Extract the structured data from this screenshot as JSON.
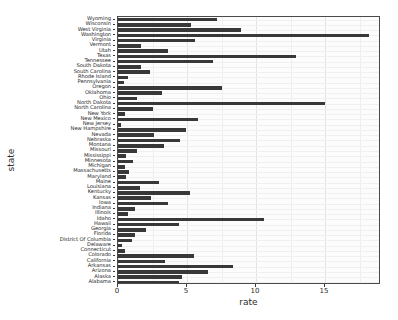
{
  "chart_data": {
    "type": "bar",
    "orientation": "horizontal",
    "title": "",
    "xlabel": "rate",
    "ylabel": "state",
    "xlim": [
      0,
      19.05
    ],
    "xticks": [
      0,
      5,
      10,
      15
    ],
    "xtick_labels": [
      "0",
      "5",
      "10",
      "15"
    ],
    "grid": true,
    "legend": "none",
    "bar_color": "#383838",
    "panel_color": "#fcfcfc",
    "categories": [
      "Wyoming",
      "Wisconsin",
      "West Virginia",
      "Washington",
      "Virginia",
      "Vermont",
      "Utah",
      "Texas",
      "Tennessee",
      "South Dakota",
      "South Carolina",
      "Rhode Island",
      "Pennsylvania",
      "Oregon",
      "Oklahoma",
      "Ohio",
      "North Dakota",
      "North Carolina",
      "New York",
      "New Mexico",
      "New Jersey",
      "New Hampshire",
      "Nevada",
      "Nebraska",
      "Montana",
      "Missouri",
      "Mississippi",
      "Minnesota",
      "Michigan",
      "Massachusetts",
      "Maryland",
      "Maine",
      "Louisiana",
      "Kentucky",
      "Kansas",
      "Iowa",
      "Indiana",
      "Illinois",
      "Idaho",
      "Hawaii",
      "Georgia",
      "Florida",
      "District Of Columbia",
      "Delaware",
      "Connecticut",
      "Colorado",
      "California",
      "Arkansas",
      "Arizona",
      "Alaska",
      "Alabama"
    ],
    "values": [
      7.2,
      5.3,
      8.9,
      18.2,
      5.6,
      1.7,
      3.6,
      12.9,
      6.9,
      1.7,
      2.3,
      0.7,
      0.4,
      7.5,
      3.2,
      1.4,
      15.0,
      2.5,
      0.5,
      5.8,
      0.2,
      4.9,
      2.6,
      4.5,
      3.3,
      1.4,
      0.6,
      1.1,
      0.5,
      0.8,
      0.6,
      3.0,
      1.6,
      5.2,
      2.4,
      3.6,
      1.2,
      0.7,
      10.6,
      4.4,
      2.0,
      1.2,
      1.0,
      0.3,
      0.5,
      5.5,
      3.4,
      8.3,
      6.5,
      4.6,
      4.4
    ],
    "value_axis_label": "rate",
    "category_axis_label": "state",
    "n_categories": 51
  }
}
